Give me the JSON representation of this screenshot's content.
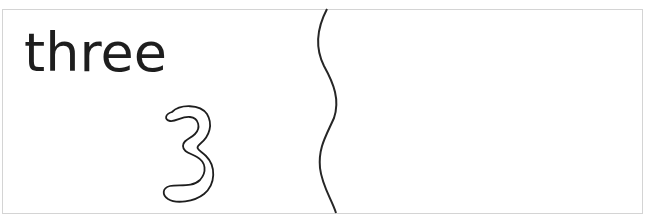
{
  "card": {
    "word": "three",
    "numeral": "3",
    "numeral_style": "outline",
    "divider": "wavy-cut-line"
  },
  "colors": {
    "ink": "#1e1e1e",
    "border": "#d4d4d4",
    "background": "#ffffff"
  }
}
